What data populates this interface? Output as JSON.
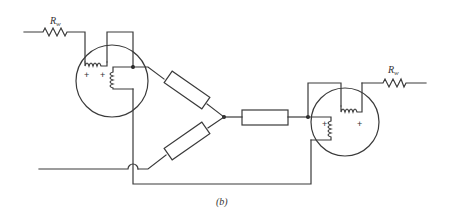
{
  "figure": {
    "caption": "(b)"
  },
  "components": {
    "left_resistor_label": "R",
    "left_resistor_subscript": "w",
    "right_resistor_label": "R",
    "right_resistor_subscript": "w",
    "left_machine_polarity": [
      "+",
      "+"
    ],
    "right_machine_polarity": [
      "+",
      "+"
    ],
    "resistive_elements": [
      "upper-diagonal-resistor",
      "lower-diagonal-resistor",
      "horizontal-resistor"
    ]
  },
  "colors": {
    "line": "#3a3a3a",
    "background": "#ffffff"
  }
}
